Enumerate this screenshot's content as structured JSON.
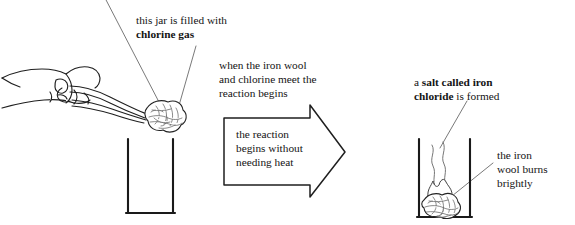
{
  "diagram": {
    "type": "science-illustration",
    "colors": {
      "ink": "#141414",
      "line": "#2b2b2b",
      "leader": "#555555",
      "paper": "#ffffff"
    },
    "labels": {
      "chlorine_gas": {
        "line1_plain": "this jar is filled with",
        "line2_bold": "chlorine gas"
      },
      "reaction_begins": {
        "line1": "when the iron wool",
        "line2": "and chlorine meet the",
        "line3": "reaction begins"
      },
      "no_heat_needed": {
        "line1": "the reaction",
        "line2": "begins without",
        "line3": "needing heat"
      },
      "salt_formed": {
        "line1_plain": "a ",
        "line1_bold": "salt called iron",
        "line2_bold": "chloride",
        "line2_plain": " is formed"
      },
      "burns_brightly": {
        "line1": "the iron",
        "line2": "wool burns",
        "line3": "brightly"
      }
    },
    "figures": {
      "hand": "hand-gripping-tongs",
      "tongs": "laboratory-tongs",
      "iron_wool_left": "iron-wool-on-tongs",
      "jar_left": "open-gas-jar-empty",
      "arrow": "right-pointing-process-arrow",
      "jar_right": "open-gas-jar-with-reaction",
      "iron_wool_right": "iron-wool-burning",
      "flame": "flame",
      "smoke": "smoke-wisps"
    }
  }
}
